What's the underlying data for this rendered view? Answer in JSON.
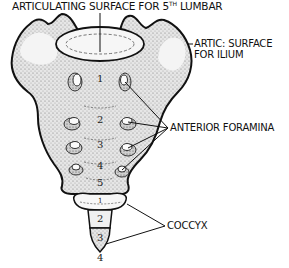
{
  "diagram": {
    "colors": {
      "ink": "#111111",
      "bone_fill": "#d9d9d9",
      "stipple": "#8a8a8a",
      "background": "#ffffff"
    },
    "labels": {
      "top": {
        "main": "ARTICULATING SURFACE FOR 5",
        "sup": "TH",
        "tail": " LUMBAR"
      },
      "ilium_line1": "ARTIC: SURFACE",
      "ilium_line2": "FOR ILIUM",
      "foramina": "ANTERIOR FORAMINA",
      "coccyx": "COCCYX"
    },
    "sacral_vertebrae": [
      "1",
      "2",
      "3",
      "4",
      "5"
    ],
    "coccygeal_vertebrae": [
      "1",
      "2",
      "3",
      "4"
    ]
  }
}
